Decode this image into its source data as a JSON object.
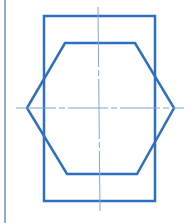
{
  "diagram": {
    "type": "technical-drawing",
    "colors": {
      "stroke": "#2f6fc0",
      "centerline": "#7fa6d8",
      "border": "#6f93c9",
      "background": "#ffffff"
    },
    "shapes": {
      "rectangle": {
        "x": 44,
        "y": 16,
        "width": 111,
        "height": 185
      },
      "hexagon": {
        "points": "65,43 135,43 174,108 137,174 67,174 27,108"
      },
      "horizontal_centerline": {
        "x1": 16,
        "y1": 108,
        "x2": 184,
        "y2": 108
      },
      "vertical_centerline": {
        "x1": 98,
        "y1": 7,
        "x2": 100,
        "y2": 211
      },
      "left_border": {
        "x1": 5,
        "y1": 0,
        "x2": 5,
        "y2": 223
      }
    }
  }
}
